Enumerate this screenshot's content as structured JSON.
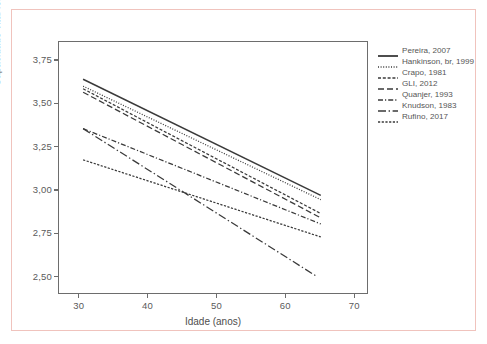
{
  "chart_data": {
    "type": "line",
    "title": "",
    "xlabel": "Idade (anos)",
    "ylabel": "Capacidade vital forçada (L)",
    "xlim": [
      27,
      72
    ],
    "ylim": [
      2.4,
      3.86
    ],
    "xticks": [
      30,
      40,
      50,
      60,
      70
    ],
    "xtick_labels": [
      "30",
      "40",
      "50",
      "60",
      "70"
    ],
    "yticks": [
      2.5,
      2.75,
      3.0,
      3.25,
      3.5,
      3.75
    ],
    "ytick_labels": [
      "2,50",
      "2,75",
      "3,00",
      "3,25",
      "3,50",
      "3,75"
    ],
    "grid": false,
    "legend_position": "right",
    "x": [
      30.5,
      65
    ],
    "series": [
      {
        "name": "Pereira, 2007",
        "style": "solid",
        "color": "#3a3a3a",
        "x": [
          30.5,
          65
        ],
        "values": [
          3.645,
          2.975
        ]
      },
      {
        "name": "Hankinson, br, 1999",
        "style": "dotted",
        "color": "#3a3a3a",
        "x": [
          30.5,
          65
        ],
        "values": [
          3.605,
          2.95
        ]
      },
      {
        "name": "Crapo, 1981",
        "style": "dashed-short",
        "color": "#3a3a3a",
        "x": [
          30.5,
          65
        ],
        "values": [
          3.59,
          2.87
        ]
      },
      {
        "name": "GLI, 2012",
        "style": "dashed-long",
        "color": "#3a3a3a",
        "x": [
          30.5,
          65
        ],
        "values": [
          3.57,
          2.845
        ]
      },
      {
        "name": "Quanjer, 1993",
        "style": "dashdot-short",
        "color": "#3a3a3a",
        "x": [
          30.5,
          65
        ],
        "values": [
          3.36,
          2.81
        ]
      },
      {
        "name": "Knudson, 1983",
        "style": "dashdot-long",
        "color": "#3a3a3a",
        "x": [
          30.5,
          64.5
        ],
        "values": [
          3.36,
          2.505
        ]
      },
      {
        "name": "Rufino, 2017",
        "style": "dotted-dense",
        "color": "#3a3a3a",
        "x": [
          30.5,
          65
        ],
        "values": [
          3.18,
          2.735
        ]
      }
    ]
  },
  "legend": {
    "items": [
      {
        "label": "Pereira, 2007"
      },
      {
        "label": "Hankinson, br, 1999"
      },
      {
        "label": "Crapo, 1981"
      },
      {
        "label": "GLI, 2012"
      },
      {
        "label": "Quanjer, 1993"
      },
      {
        "label": "Knudson, 1983"
      },
      {
        "label": "Rufino, 2017"
      }
    ]
  },
  "colors": {
    "line": "#3a3a3a",
    "axis": "#6d6d6d",
    "text": "#555555",
    "figure_border": "#f0c3bd",
    "background": "#ffffff"
  }
}
